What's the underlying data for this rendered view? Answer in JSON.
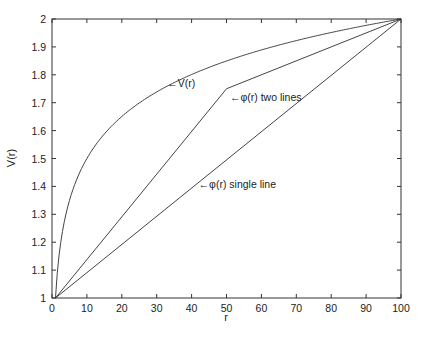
{
  "chart_data": {
    "type": "line",
    "title": "",
    "xlabel": "r",
    "ylabel": "V(r)",
    "xlim": [
      0,
      100
    ],
    "ylim": [
      1,
      2
    ],
    "grid": false,
    "xticks": [
      0,
      10,
      20,
      30,
      40,
      50,
      60,
      70,
      80,
      90,
      100
    ],
    "yticks": [
      1,
      1.1,
      1.2,
      1.3,
      1.4,
      1.5,
      1.6,
      1.7,
      1.8,
      1.9,
      2
    ],
    "series": [
      {
        "name": "V(r)",
        "x": [
          1,
          2,
          3,
          5,
          7,
          10,
          15,
          20,
          25,
          30,
          40,
          50,
          60,
          70,
          80,
          90,
          100
        ],
        "y": [
          1.0,
          1.15,
          1.24,
          1.35,
          1.42,
          1.5,
          1.59,
          1.65,
          1.7,
          1.74,
          1.8,
          1.85,
          1.89,
          1.92,
          1.95,
          1.98,
          2.0
        ]
      },
      {
        "name": "φ(r) two lines",
        "x": [
          1,
          50,
          100
        ],
        "y": [
          1.0,
          1.75,
          2.0
        ]
      },
      {
        "name": "φ(r) single line",
        "x": [
          1,
          100
        ],
        "y": [
          1.0,
          2.0
        ]
      }
    ],
    "annotations": [
      {
        "text": "←V(r)",
        "x": 33,
        "y": 1.77
      },
      {
        "text": "←φ(r) two lines",
        "x": 51,
        "y": 1.72
      },
      {
        "text": "←φ(r) single line",
        "x": 42,
        "y": 1.41
      }
    ]
  }
}
